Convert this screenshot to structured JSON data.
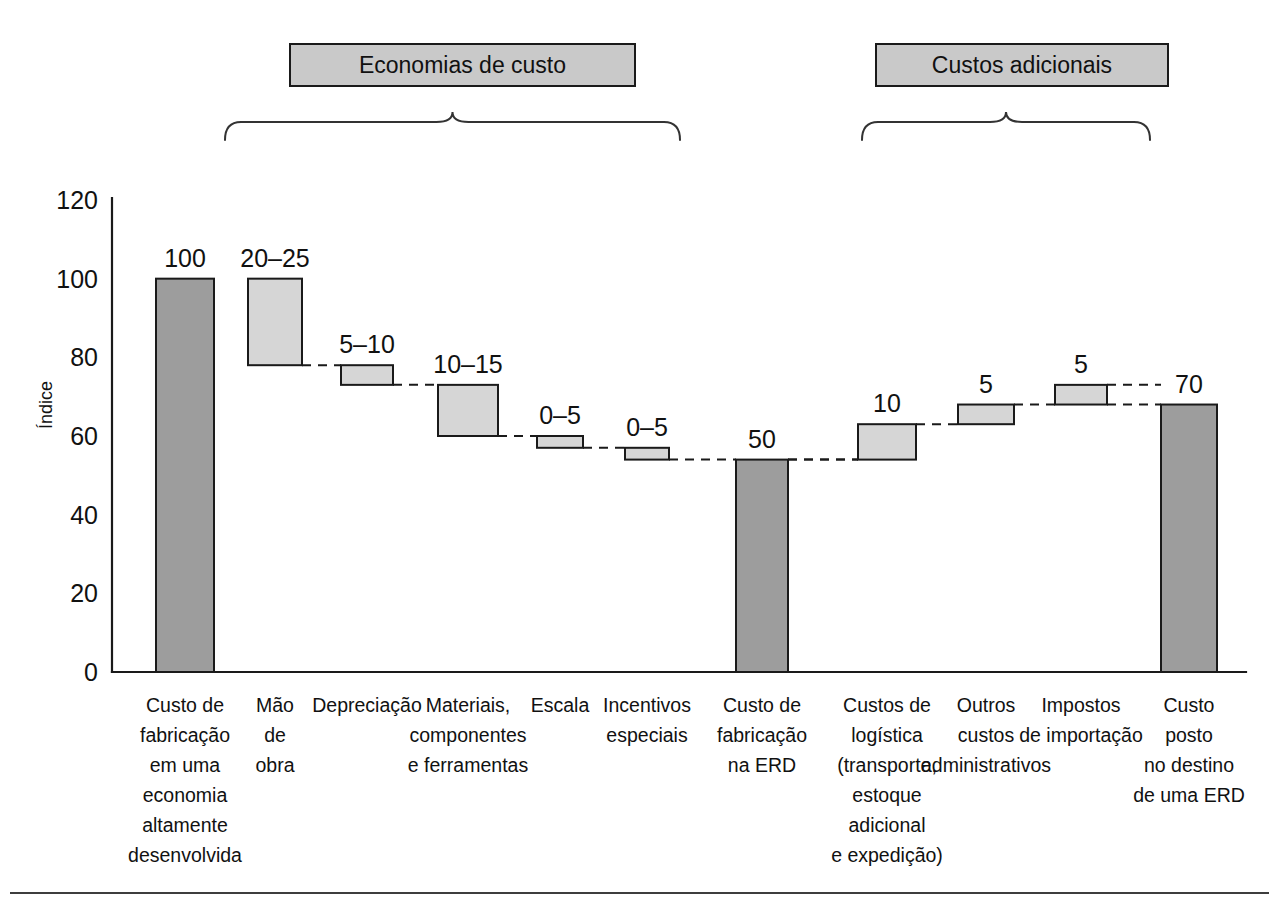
{
  "figure": {
    "y_axis_title": "Índice",
    "group_headers": [
      {
        "id": "savings",
        "label": "Economias de custo"
      },
      {
        "id": "additional",
        "label": "Custos adicionais"
      }
    ]
  },
  "chart_data": {
    "type": "bar",
    "subtype": "waterfall",
    "title": "",
    "xlabel": "",
    "ylabel": "Índice",
    "ylim": [
      0,
      120
    ],
    "yticks": [
      0,
      20,
      40,
      60,
      80,
      100,
      120
    ],
    "ytick_labels": [
      "0",
      "20",
      "40",
      "60",
      "80",
      "100",
      "120"
    ],
    "grid": false,
    "legend": "none",
    "colors": {
      "total_bar": "#9d9d9d",
      "delta_bar": "#d6d6d6",
      "outline": "#1a1a1a",
      "header_box": "#c9c9c9",
      "connector": "#1a1a1a"
    },
    "categories": [
      "Custo de fabricação em uma economia altamente desenvolvida",
      "Mão de obra",
      "Depreciação",
      "Materiais, componentes e ferramentas",
      "Escala",
      "Incentivos especiais",
      "Custo de fabricação na ERD",
      "Custos de logística (transporte, estoque adicional e expedição)",
      "Outros custos administrativos",
      "Impostos de importação",
      "Custo posto no destino de uma ERD"
    ],
    "bars": [
      {
        "key": "custo-fabricacao-ed",
        "label_lines": [
          "Custo de",
          "fabricação",
          "em uma",
          "economia",
          "altamente",
          "desenvolvida"
        ],
        "value_label": "100",
        "kind": "total",
        "base": 0,
        "top": 100,
        "group": "none"
      },
      {
        "key": "mao-de-obra",
        "label_lines": [
          "Mão",
          "de",
          "obra"
        ],
        "value_label": "20–25",
        "kind": "delta",
        "base": 78,
        "top": 100,
        "group": "savings"
      },
      {
        "key": "depreciacao",
        "label_lines": [
          "Depreciação"
        ],
        "value_label": "5–10",
        "kind": "delta",
        "base": 73,
        "top": 78,
        "group": "savings"
      },
      {
        "key": "materiais-componentes-ferramentas",
        "label_lines": [
          "Materiais,",
          "componentes",
          "e ferramentas"
        ],
        "value_label": "10–15",
        "kind": "delta",
        "base": 60,
        "top": 73,
        "group": "savings"
      },
      {
        "key": "escala",
        "label_lines": [
          "Escala"
        ],
        "value_label": "0–5",
        "kind": "delta",
        "base": 57,
        "top": 60,
        "group": "savings"
      },
      {
        "key": "incentivos-especiais",
        "label_lines": [
          "Incentivos",
          "especiais"
        ],
        "value_label": "0–5",
        "kind": "delta",
        "base": 54,
        "top": 57,
        "group": "savings"
      },
      {
        "key": "custo-fabricacao-erd",
        "label_lines": [
          "Custo de",
          "fabricação",
          "na ERD"
        ],
        "value_label": "50",
        "kind": "total",
        "base": 0,
        "top": 54,
        "group": "none"
      },
      {
        "key": "custos-logistica",
        "label_lines": [
          "Custos de",
          "logística",
          "(transporte,",
          "estoque",
          "adicional",
          "e expedição)"
        ],
        "value_label": "10",
        "kind": "delta",
        "base": 54,
        "top": 63,
        "group": "additional"
      },
      {
        "key": "outros-custos-administrativos",
        "label_lines": [
          "Outros",
          "custos",
          "administrativos"
        ],
        "value_label": "5",
        "kind": "delta",
        "base": 63,
        "top": 68,
        "group": "additional"
      },
      {
        "key": "impostos-de-importacao",
        "label_lines": [
          "Impostos",
          "de importação"
        ],
        "value_label": "5",
        "kind": "delta",
        "base": 68,
        "top": 73,
        "group": "additional"
      },
      {
        "key": "custo-posto-destino-erd",
        "label_lines": [
          "Custo",
          "posto",
          "no destino",
          "de uma ERD"
        ],
        "value_label": "70",
        "kind": "total",
        "base": 0,
        "top": 68,
        "group": "none"
      }
    ]
  }
}
